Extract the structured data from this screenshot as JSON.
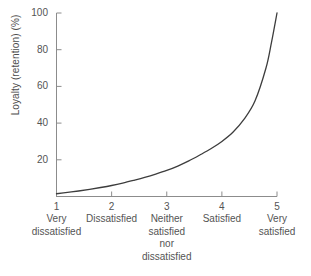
{
  "chart_data": {
    "type": "line",
    "title": "",
    "subtitle": "",
    "xlabel": "",
    "ylabel": "Loyalty (retention) (%)",
    "xlim": [
      1,
      5
    ],
    "ylim": [
      0,
      100
    ],
    "grid": false,
    "legend": null,
    "y_ticks": [
      {
        "value": 100,
        "label": "100"
      },
      {
        "value": 80,
        "label": "80"
      },
      {
        "value": 60,
        "label": "60"
      },
      {
        "value": 40,
        "label": "40"
      },
      {
        "value": 20,
        "label": "20"
      }
    ],
    "x_ticks": [
      {
        "value": 1,
        "label": "1",
        "category": [
          "Very",
          "dissatisfied"
        ]
      },
      {
        "value": 2,
        "label": "2",
        "category": [
          "Dissatisfied"
        ]
      },
      {
        "value": 3,
        "label": "3",
        "category": [
          "Neither",
          "satisfied",
          "nor",
          "dissatisfied"
        ]
      },
      {
        "value": 4,
        "label": "4",
        "category": [
          "Satisfied"
        ]
      },
      {
        "value": 5,
        "label": "5",
        "category": [
          "Very",
          "satisfied"
        ]
      }
    ],
    "series": [
      {
        "name": "Loyalty curve",
        "color": "#3d3d3d",
        "x": [
          1.0,
          1.2,
          1.4,
          1.6,
          1.8,
          2.0,
          2.2,
          2.4,
          2.6,
          2.8,
          3.0,
          3.2,
          3.4,
          3.6,
          3.8,
          4.0,
          4.2,
          4.4,
          4.6,
          4.8,
          4.9,
          5.0
        ],
        "values": [
          1.5,
          2.2,
          3.0,
          3.9,
          4.9,
          6.0,
          7.3,
          8.8,
          10.4,
          12.2,
          14.2,
          16.6,
          19.4,
          22.6,
          26.0,
          30.0,
          35.0,
          42.0,
          52.0,
          70.0,
          84.0,
          100.0
        ]
      }
    ]
  },
  "axis_colors": {
    "axis_line": "#8c8c8c",
    "tick": "#8c8c8c",
    "curve": "#3d3d3d",
    "text": "#545454",
    "background": "#ffffff"
  }
}
